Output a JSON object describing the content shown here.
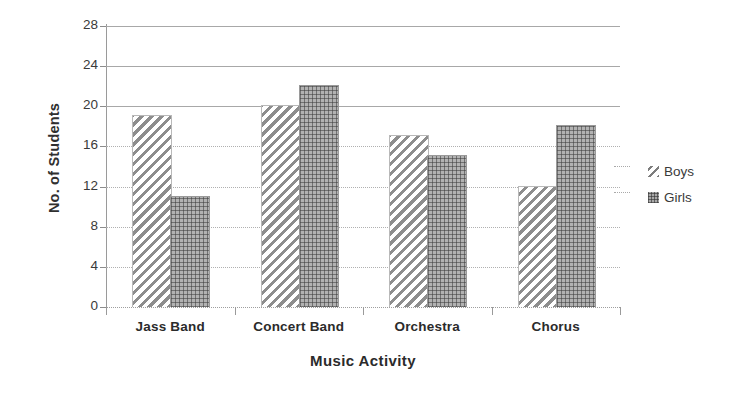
{
  "chart_data": {
    "type": "bar",
    "title": "",
    "xlabel": "Music Activity",
    "ylabel": "No. of Students",
    "categories": [
      "Jass Band",
      "Concert Band",
      "Orchestra",
      "Chorus"
    ],
    "series": [
      {
        "name": "Boys",
        "values": [
          19,
          20,
          17,
          12
        ],
        "pattern": "diagonal-hatch"
      },
      {
        "name": "Girls",
        "values": [
          11,
          22,
          15,
          18
        ],
        "pattern": "dotted-mesh"
      }
    ],
    "ylim": [
      0,
      28
    ],
    "ystep": 4,
    "yticks": [
      "0",
      "4",
      "8",
      "12",
      "16",
      "20",
      "24",
      "28"
    ],
    "grid": true,
    "legend_position": "right",
    "colors": {
      "boys_hatch": "#8d8d8d",
      "girls_fill": "#b2b2b2",
      "gridline": "#a8a8a8",
      "axis": "#9a9a9a",
      "text": "#2b2b2b"
    }
  },
  "legend": {
    "items": [
      {
        "label": "Boys",
        "icon": "diagonal-line-swatch"
      },
      {
        "label": "Girls",
        "icon": "dotted-square-swatch"
      }
    ]
  },
  "ghost": {
    "partial_title": ""
  }
}
